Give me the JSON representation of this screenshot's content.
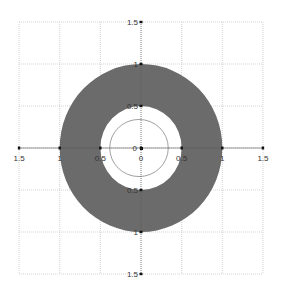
{
  "chart_data": {
    "type": "polar-region",
    "title": "",
    "xlim": [
      -1.5,
      1.5
    ],
    "ylim": [
      -1.5,
      1.5
    ],
    "grid": true,
    "grid_step": 0.5,
    "x_tick_labels": [
      "1.5",
      "1",
      "0.5",
      "0",
      "0.5",
      "1",
      "1.5"
    ],
    "y_tick_labels": [
      "1.5",
      "1",
      "0.5",
      "0",
      "0.5",
      "1",
      "1.5"
    ],
    "x_ticks": [
      -1.5,
      -1,
      -0.5,
      0,
      0.5,
      1,
      1.5
    ],
    "y_ticks": [
      1.5,
      1,
      0.5,
      0,
      -0.5,
      -1,
      -1.5
    ],
    "shapes": [
      {
        "kind": "annulus",
        "inner_radius": 0.5,
        "outer_radius": 1.0,
        "fill": "#6b6b6b"
      },
      {
        "kind": "circle",
        "radius": 0.5,
        "stroke": "#777777",
        "dashed": false
      }
    ],
    "colors": {
      "fill": "#6b6b6b",
      "grid": "#c8c8c8",
      "axis": "#555555"
    }
  }
}
